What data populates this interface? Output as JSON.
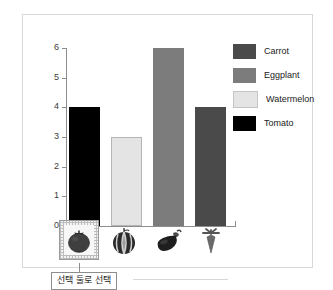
{
  "chart_data": {
    "type": "bar",
    "title": "",
    "xlabel": "",
    "ylabel": "",
    "ylim": [
      0,
      6
    ],
    "grid": false,
    "legend_position": "right",
    "categories": [
      "Tomato",
      "Watermelon",
      "Eggplant",
      "Carrot"
    ],
    "values": [
      4,
      3,
      6,
      4
    ],
    "y_ticks": [
      "0",
      "1",
      "2",
      "3",
      "4",
      "5",
      "6"
    ],
    "series": [
      {
        "name": "Tomato",
        "value": 4,
        "color": "#000000",
        "icon": "tomato-icon"
      },
      {
        "name": "Watermelon",
        "value": 3,
        "color": "#e4e4e4",
        "icon": "watermelon-icon"
      },
      {
        "name": "Eggplant",
        "value": 6,
        "color": "#7c7c7c",
        "icon": "eggplant-icon"
      },
      {
        "name": "Carrot",
        "value": 4,
        "color": "#4a4a4a",
        "icon": "carrot-icon"
      }
    ]
  },
  "legend": {
    "items": [
      {
        "label": "Carrot",
        "color": "#4a4a4a"
      },
      {
        "label": "Eggplant",
        "color": "#7c7c7c"
      },
      {
        "label": "Watermelon",
        "color": "#e4e4e4"
      },
      {
        "label": "Tomato",
        "color": "#000000"
      }
    ]
  },
  "icon_strip": {
    "items": [
      {
        "name": "tomato-icon",
        "selected": true
      },
      {
        "name": "watermelon-icon",
        "selected": false
      },
      {
        "name": "eggplant-icon",
        "selected": false
      },
      {
        "name": "carrot-icon",
        "selected": false
      }
    ]
  },
  "callout": {
    "text": "선택 둘로 선택"
  },
  "colors": {
    "panel_border": "#d8d8d8",
    "axis": "#8d8d8d",
    "tick_text": "#3c3c3c",
    "selection_border": "#9a9a9a"
  }
}
